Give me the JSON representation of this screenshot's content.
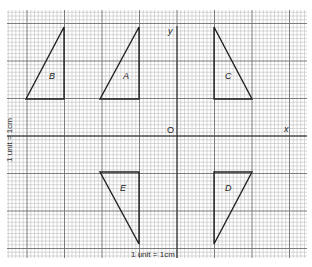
{
  "grid": {
    "left": 7,
    "top": 10,
    "right": 307,
    "bottom": 258,
    "minor_step": 3.75,
    "major_every": 10,
    "minor_color": "#bdbdbd",
    "major_color": "#6e6e6e"
  },
  "axes": {
    "origin_px": [
      177,
      136
    ],
    "x_label": "x",
    "y_label": "y",
    "origin_label": "O",
    "color": "#333333"
  },
  "scale_labels": {
    "bottom": "1 unit = 1cm",
    "side": "1 unit = 1cm"
  },
  "shapes": [
    {
      "name": "B",
      "points": [
        [
          26,
          99
        ],
        [
          64,
          27
        ],
        [
          64,
          99
        ]
      ],
      "label_pos": [
        49,
        72
      ]
    },
    {
      "name": "A",
      "points": [
        [
          100,
          99
        ],
        [
          139,
          27
        ],
        [
          139,
          99
        ]
      ],
      "label_pos": [
        123,
        72
      ]
    },
    {
      "name": "C",
      "points": [
        [
          214,
          27
        ],
        [
          214,
          99
        ],
        [
          252,
          99
        ]
      ],
      "label_pos": [
        225,
        72
      ]
    },
    {
      "name": "E",
      "points": [
        [
          100,
          172
        ],
        [
          139,
          172
        ],
        [
          139,
          244
        ]
      ],
      "label_pos": [
        120,
        184
      ]
    },
    {
      "name": "D",
      "points": [
        [
          214,
          172
        ],
        [
          252,
          172
        ],
        [
          214,
          244
        ]
      ],
      "label_pos": [
        225,
        184
      ]
    }
  ],
  "stroke_color": "#222222"
}
